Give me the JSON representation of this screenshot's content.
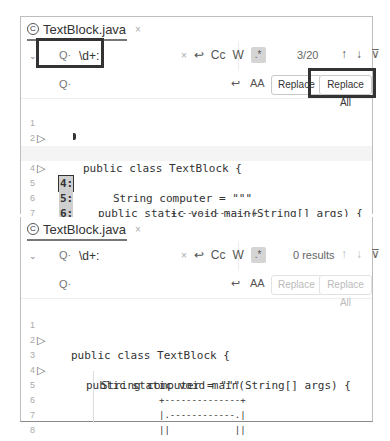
{
  "panels": [
    {
      "tab": {
        "icon": "class-icon",
        "icon_glyph": "C",
        "name": "TextBlock.java",
        "close": "×"
      },
      "find": {
        "query": "\\d+:",
        "search_icon": "Q·",
        "clear": "×",
        "newline_icon": "↩",
        "match_case": "Cc",
        "words": "W",
        "regex": ".*",
        "result_count": "3/20",
        "prev": "↑",
        "next": "↓",
        "filter": "⊽"
      },
      "replace": {
        "value": "",
        "search_icon": "Q·",
        "preserve_newline_icon": "↩",
        "preserve_case_icon": "AA",
        "replace_label": "Replace",
        "replace_all_label": "Replace All"
      },
      "code_lines": [
        {
          "num": "1",
          "run": "▷",
          "match": "1:",
          "text": "public class TextBlock {",
          "indent": 0
        },
        {
          "num": "2",
          "run": "",
          "match": "2:",
          "text": "",
          "indent": 0
        },
        {
          "num": "3",
          "run": "▷",
          "match": "3:",
          "text": "public static void main(String[] args) {",
          "indent": 1,
          "current_match": true
        },
        {
          "num": "4",
          "run": "",
          "match": "4:",
          "text": "String computer = \"\"\"",
          "indent": 2,
          "current_line": true
        },
        {
          "num": "5",
          "run": "",
          "match": "5:",
          "text": "+--------------+",
          "indent": 3
        },
        {
          "num": "6",
          "run": "",
          "match": "6:",
          "text": "|.------------.|",
          "indent": 3
        },
        {
          "num": "7",
          "run": "",
          "match": "7:",
          "text": "||            ||",
          "indent": 3
        },
        {
          "num": "8",
          "run": "",
          "match": "8:",
          "text": "||            ||",
          "indent": 3
        }
      ]
    },
    {
      "tab": {
        "icon": "class-icon",
        "icon_glyph": "C",
        "name": "TextBlock.java",
        "close": "×"
      },
      "find": {
        "query": "\\d+:",
        "search_icon": "Q·",
        "clear": "×",
        "newline_icon": "↩",
        "match_case": "Cc",
        "words": "W",
        "regex": ".*",
        "result_count": "0 results",
        "prev": "↑",
        "next": "↓",
        "filter": "⊽"
      },
      "replace": {
        "value": "",
        "search_icon": "Q·",
        "preserve_newline_icon": "↩",
        "preserve_case_icon": "AA",
        "replace_label": "Replace",
        "replace_all_label": "Replace All"
      },
      "code_lines": [
        {
          "num": "1",
          "run": "▷",
          "text": "public class TextBlock {",
          "indent": 0
        },
        {
          "num": "2",
          "run": "",
          "text": "",
          "indent": 0
        },
        {
          "num": "3",
          "run": "▷",
          "text": "public static void main(String[] args) {",
          "indent": 1
        },
        {
          "num": "4",
          "run": "",
          "text": "String computer = \"\"\"",
          "indent": 2
        },
        {
          "num": "5",
          "run": "",
          "text": "+--------------+",
          "indent": 3
        },
        {
          "num": "6",
          "run": "",
          "text": "|.------------.|",
          "indent": 3
        },
        {
          "num": "7",
          "run": "",
          "text": "||            ||",
          "indent": 3
        },
        {
          "num": "8",
          "run": "",
          "text": "||            ||",
          "indent": 3
        }
      ]
    }
  ],
  "colors": {
    "highlight_border": "#333333",
    "match_bg": "#cfcfcf"
  }
}
